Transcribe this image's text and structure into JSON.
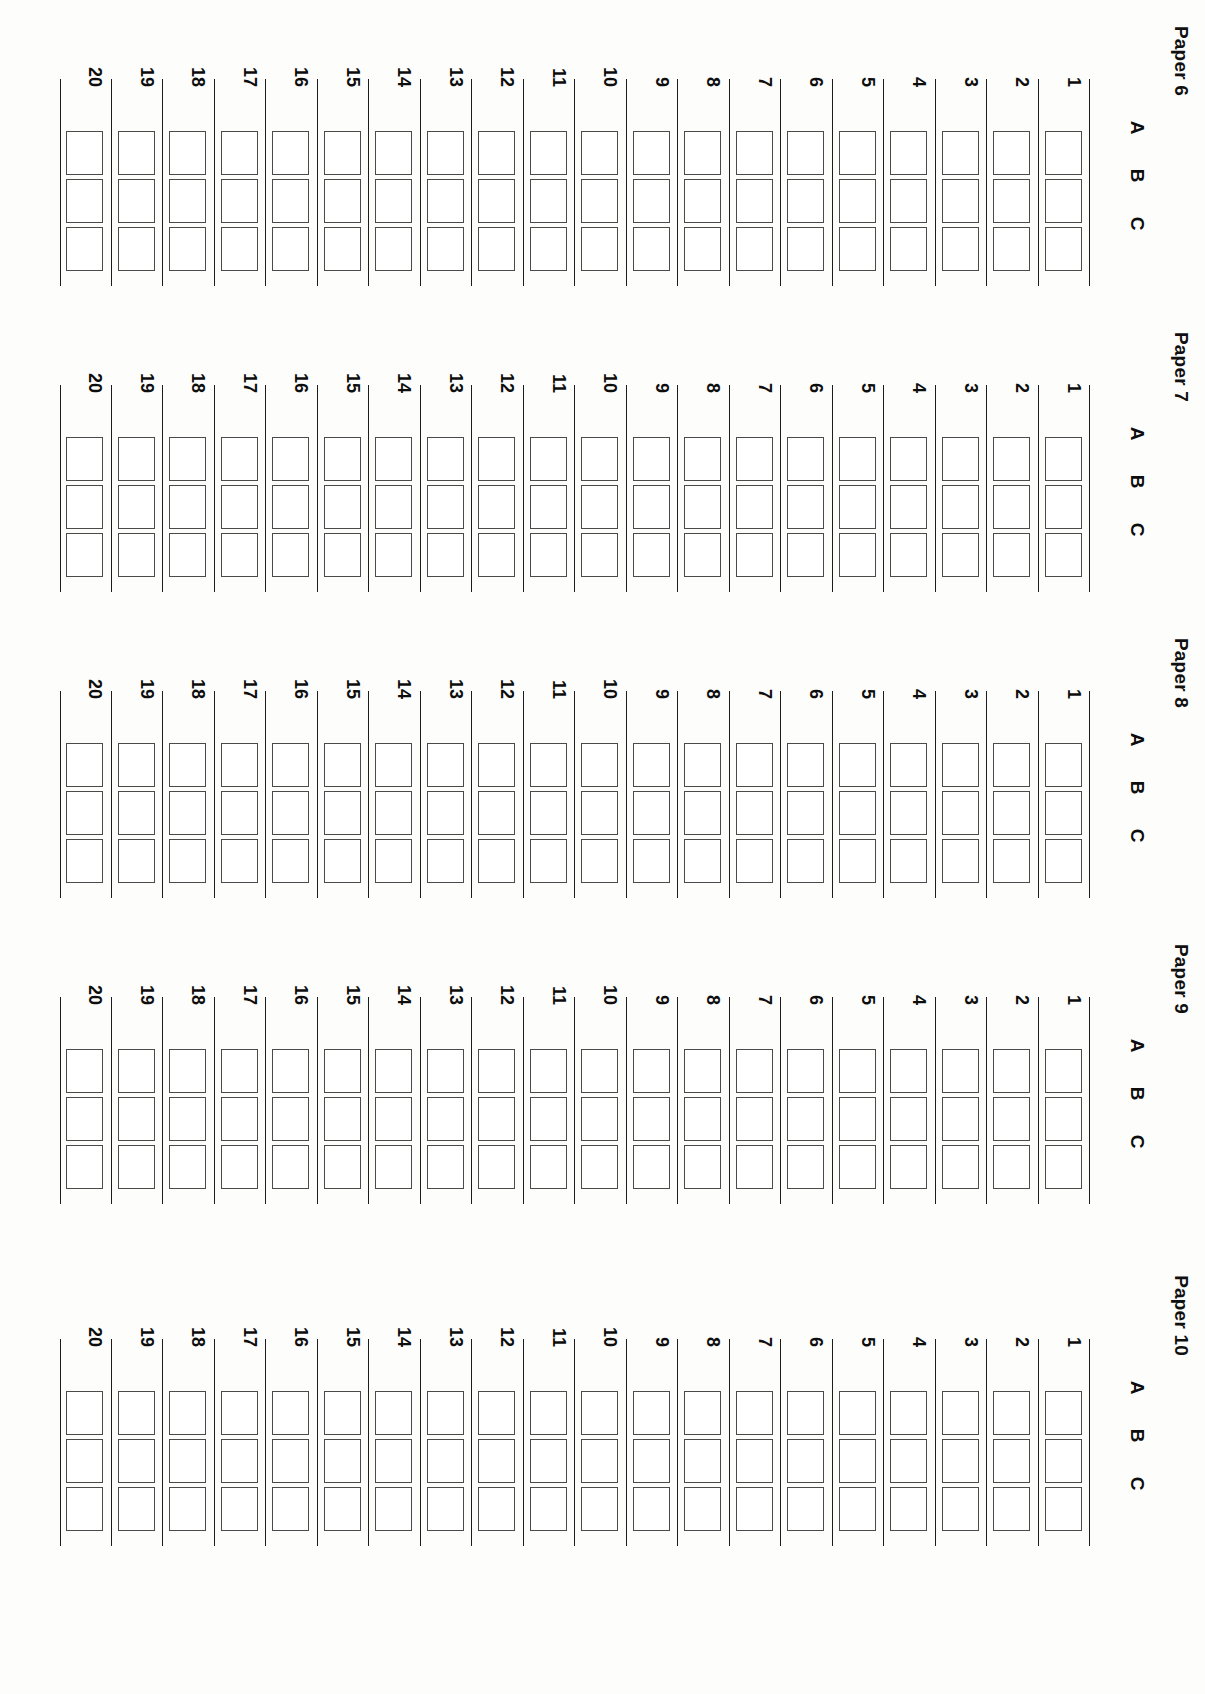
{
  "document": {
    "type": "answer-sheet-grid",
    "orientation": "rotated-90",
    "background_color": "#fdfdfc",
    "line_color": "#1d1d1d",
    "box_border_color": "#4a4a4a"
  },
  "option_columns": [
    "A",
    "B",
    "C"
  ],
  "question_numbers": [
    "1",
    "2",
    "3",
    "4",
    "5",
    "6",
    "7",
    "8",
    "9",
    "10",
    "11",
    "12",
    "13",
    "14",
    "15",
    "16",
    "17",
    "18",
    "19",
    "20"
  ],
  "blocks": [
    {
      "title": "Paper 6"
    },
    {
      "title": "Paper 7"
    },
    {
      "title": "Paper 8"
    },
    {
      "title": "Paper 9"
    },
    {
      "title": "Paper 10"
    }
  ],
  "block_tops": [
    60,
    366,
    672,
    978,
    1320
  ]
}
